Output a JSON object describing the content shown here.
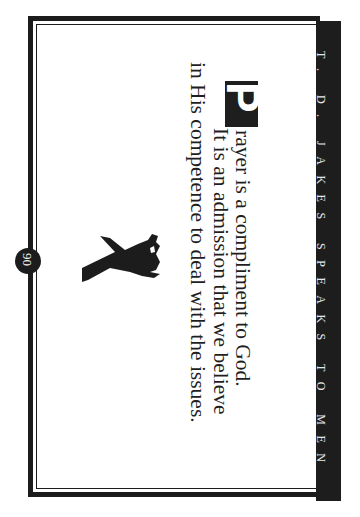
{
  "page": {
    "orientation": "rotated-90-clockwise",
    "running_head": "T. D. JAKES SPEAKS TO MEN",
    "page_number": "90",
    "quote": {
      "drop_cap": "P",
      "lines": [
        "rayer is a compliment to God.",
        "It is an admission that we believe",
        "in His competence to deal with the issues."
      ]
    },
    "figure": "running-man-silhouette",
    "colors": {
      "ink": "#1c1c1c",
      "paper": "#ffffff",
      "band_text": "#e8e8e8"
    }
  }
}
